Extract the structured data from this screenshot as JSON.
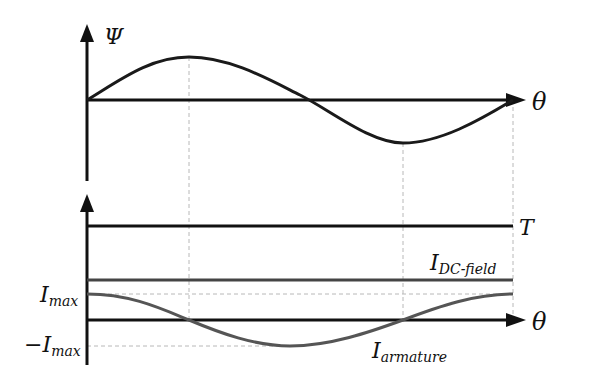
{
  "diagram": {
    "colors": {
      "axis": "#111111",
      "curve_dark": "#1a1a1a",
      "curve_grey": "#555555",
      "dashed": "#b0b0b0",
      "background": "#ffffff"
    },
    "top_plot": {
      "y_label": "Ψ",
      "x_label": "θ",
      "curve": "Ψ = sin(θ)"
    },
    "bottom_plot": {
      "x_label": "θ",
      "torque_label": "T",
      "dc_field_label_main": "I",
      "dc_field_label_sub": "DC-field",
      "armature_label_main": "I",
      "armature_label_sub": "armature",
      "imax_label_main": "I",
      "imax_label_sub": "max",
      "neg_imax_label_main": "−I",
      "neg_imax_label_sub": "max"
    }
  }
}
